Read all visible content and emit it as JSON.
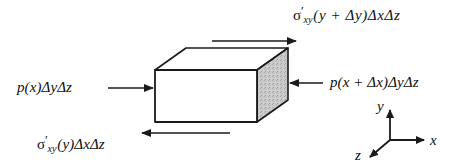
{
  "figure": {
    "background_color": "#ffffff",
    "line_color": "#1a1a1a",
    "face_colors": {
      "front": "#ffffff",
      "top": "#ffffff",
      "right": "#c9c9c9"
    }
  },
  "labels": {
    "top": {
      "sigma": "σ",
      "prime": "′",
      "subscript": "xy",
      "rest": "(y + Δy)ΔxΔz",
      "full": "σ′xy (y + Δy)ΔxΔz"
    },
    "bottom": {
      "sigma": "σ",
      "prime": "′",
      "subscript": "xy",
      "rest": "(y)ΔxΔz",
      "full": "σ′xy(y)ΔxΔz"
    },
    "left": {
      "full": "p(x)ΔyΔz"
    },
    "right": {
      "full": "p(x + Δx)ΔyΔz"
    }
  },
  "axes": {
    "x_label": "x",
    "y_label": "y",
    "z_label": "z"
  },
  "arrows": {
    "top_direction": "right",
    "bottom_direction": "left",
    "left_direction": "right",
    "right_direction": "left"
  }
}
